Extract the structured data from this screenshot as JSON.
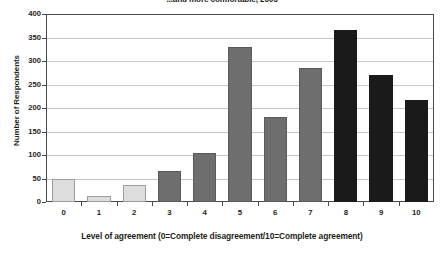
{
  "chart_data": {
    "type": "bar",
    "title": "...and more comfortable, 2005",
    "xlabel": "Level of agreement (0=Complete disagreement/10=Complete agreement)",
    "ylabel": "Number of Respondents",
    "categories": [
      "0",
      "1",
      "2",
      "3",
      "4",
      "5",
      "6",
      "7",
      "8",
      "9",
      "10"
    ],
    "values": [
      50,
      13,
      37,
      65,
      105,
      330,
      181,
      285,
      365,
      270,
      218
    ],
    "ylim": [
      0,
      400
    ],
    "yticks": [
      0,
      50,
      100,
      150,
      200,
      250,
      300,
      350,
      400
    ],
    "ytick_labels": [
      "0",
      "50",
      "100",
      "150",
      "200",
      "250",
      "300",
      "350",
      "400"
    ],
    "grid": true,
    "legend": "none",
    "bar_shades": [
      "light",
      "light",
      "light",
      "mid",
      "mid",
      "mid",
      "mid",
      "mid",
      "dark",
      "dark",
      "dark"
    ],
    "colors": {
      "light": "#dddddd",
      "light_border": "#9c9c9c",
      "mid": "#6e6e6e",
      "dark": "#1a1a1a",
      "gridline": "#c9c9c9",
      "frame": "#4a4a4a",
      "text": "#231f20"
    }
  }
}
